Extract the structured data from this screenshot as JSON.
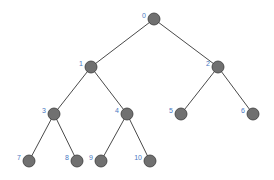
{
  "diagram": {
    "type": "binary-tree",
    "colors": {
      "edge": "#4a4a4a",
      "node_fill": "#707070",
      "node_stroke": "#3a3a3a",
      "label": "#4a78c2",
      "background": "#ffffff"
    },
    "node_radius": 6,
    "nodes": [
      {
        "id": "0",
        "label": "0",
        "x": 154,
        "y": 19
      },
      {
        "id": "1",
        "label": "1",
        "x": 91,
        "y": 67
      },
      {
        "id": "2",
        "label": "2",
        "x": 218,
        "y": 67
      },
      {
        "id": "3",
        "label": "3",
        "x": 54,
        "y": 114
      },
      {
        "id": "4",
        "label": "4",
        "x": 127,
        "y": 114
      },
      {
        "id": "5",
        "label": "5",
        "x": 181,
        "y": 114
      },
      {
        "id": "6",
        "label": "6",
        "x": 253,
        "y": 114
      },
      {
        "id": "7",
        "label": "7",
        "x": 29,
        "y": 161
      },
      {
        "id": "8",
        "label": "8",
        "x": 77,
        "y": 161
      },
      {
        "id": "9",
        "label": "9",
        "x": 101,
        "y": 161
      },
      {
        "id": "10",
        "label": "10",
        "x": 150,
        "y": 161
      }
    ],
    "edges": [
      [
        "0",
        "1"
      ],
      [
        "0",
        "2"
      ],
      [
        "1",
        "3"
      ],
      [
        "1",
        "4"
      ],
      [
        "2",
        "5"
      ],
      [
        "2",
        "6"
      ],
      [
        "3",
        "7"
      ],
      [
        "3",
        "8"
      ],
      [
        "4",
        "9"
      ],
      [
        "4",
        "10"
      ]
    ]
  }
}
